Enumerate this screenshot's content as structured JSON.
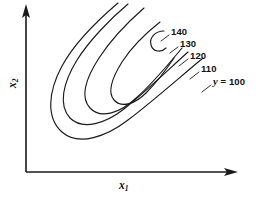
{
  "figure": {
    "type": "contour-plot",
    "background_color": "#ffffff",
    "line_color": "#1a1a1a"
  },
  "axes": {
    "x_label": "x",
    "x_subscript": "1",
    "y_label": "x",
    "y_subscript": "2",
    "origin": [
      26,
      172
    ],
    "x_axis_end": [
      236,
      172
    ],
    "y_axis_end": [
      26,
      6
    ],
    "arrowheads": "solid"
  },
  "labels": {
    "l140": "140",
    "l130": "130",
    "l120": "120",
    "l110": "110",
    "l100_var": "y",
    "l100_eq": " = 100"
  },
  "chart_data": {
    "type": "line",
    "title": "",
    "xlabel": "x1",
    "ylabel": "x2",
    "grid": false,
    "legend": "none",
    "levels": [
      100,
      110,
      120,
      130,
      140
    ],
    "level_labels": [
      "y = 100",
      "110",
      "120",
      "130",
      "140"
    ],
    "series": [
      {
        "name": "140",
        "value": 140,
        "label_anchor": [
          171,
          32
        ],
        "leader_from": [
          169,
          35
        ],
        "leader_to": [
          161,
          41
        ],
        "path": "M 164 31 C 155 31 149 38 151 45 C 153 52 161 53 166 48"
      },
      {
        "name": "130",
        "value": 130,
        "label_anchor": [
          180,
          44
        ],
        "leader_from": [
          178,
          47
        ],
        "leader_to": [
          170,
          53
        ],
        "path": "M 160 22 C 146 33 131 48 122 62 C 112 78 107 92 114 100 C 122 109 136 103 146 93 C 156 83 166 70 174 58"
      },
      {
        "name": "120",
        "value": 120,
        "label_anchor": [
          190,
          56
        ],
        "leader_from": [
          188,
          59
        ],
        "leader_to": [
          179,
          66
        ],
        "path": "M 144 8 C 128 22 110 41 99 58 C 86 78 80 97 90 108 C 101 120 121 112 135 99 C 151 85 168 65 182 48"
      },
      {
        "name": "110",
        "value": 110,
        "label_anchor": [
          201,
          69
        ],
        "leader_from": [
          199,
          72
        ],
        "leader_to": [
          190,
          79
        ],
        "path": "M 128 4 C 110 19 89 41 77 60 C 63 83 58 105 70 118 C 83 131 106 123 124 109 C 143 94 168 70 188 52"
      },
      {
        "name": "100",
        "value": 100,
        "label_anchor": [
          213,
          82
        ],
        "leader_from": [
          211,
          85
        ],
        "leader_to": [
          202,
          92
        ],
        "path": "M 118 3 C 98 20 74 44 62 66 C 48 92 46 118 62 132 C 79 147 107 136 128 120 C 152 102 180 77 203 58"
      }
    ]
  }
}
